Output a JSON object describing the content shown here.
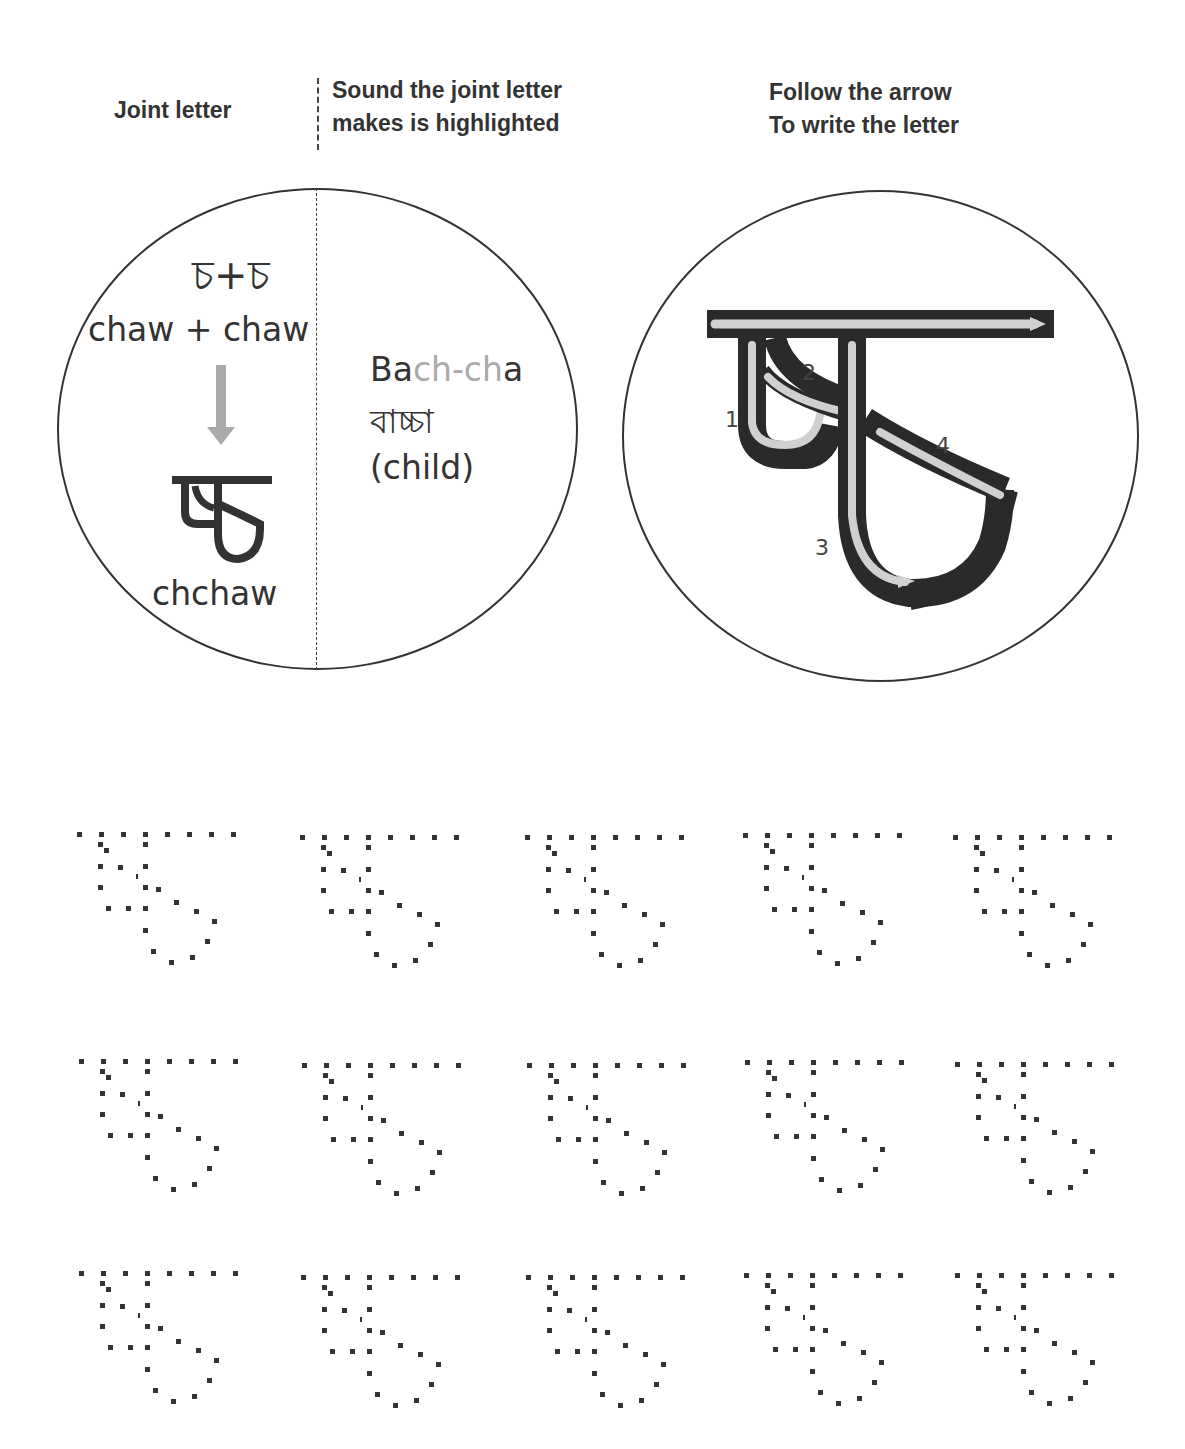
{
  "headers": {
    "joint_letter": "Joint letter",
    "sound_line1": "Sound the joint letter",
    "sound_line2": "makes is highlighted",
    "follow_line1": "Follow the arrow",
    "follow_line2": "To write the letter"
  },
  "left_circle": {
    "components_glyph": "চ+চ",
    "components_roman": "chaw + chaw",
    "arrow_icon": "down-arrow-icon",
    "joint_glyph": "চ্চ",
    "joint_roman": "chchaw",
    "example": {
      "word_prefix": "Ba",
      "word_highlight": "ch-ch",
      "word_suffix": "a",
      "bengali": "বাচ্চা",
      "meaning": "(child)"
    },
    "highlight_color": "#aaaaaa"
  },
  "right_circle": {
    "stroke_numbers": [
      "1",
      "2",
      "3",
      "4"
    ],
    "stroke_color": "#2a2a2a",
    "arrow_color": "#d0d0d0"
  },
  "practice_grid": {
    "rows": 3,
    "columns": 5,
    "total_patterns": 15
  }
}
